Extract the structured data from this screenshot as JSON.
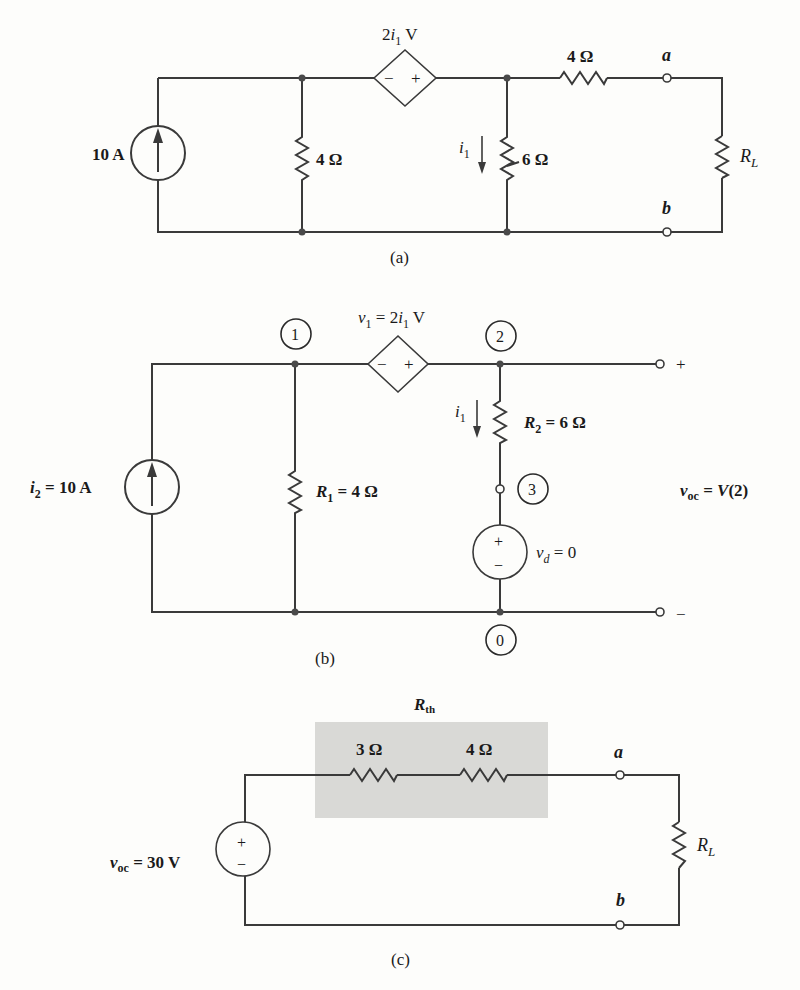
{
  "header_fragment": "… the 5-Ω resistor … figure … Thevenin … equivalent … gain …",
  "figure_a": {
    "caption": "(a)",
    "current_source": "10 A",
    "dependent_source": {
      "prefix": "2",
      "var": "i",
      "sub": "1",
      "unit": " V",
      "minus": "−",
      "plus": "+"
    },
    "resistor_shunt_left": "4 Ω",
    "resistor_shunt_right": "6 Ω",
    "resistor_series": "4 Ω",
    "current_label": {
      "var": "i",
      "sub": "1"
    },
    "terminal_a": "a",
    "terminal_b": "b",
    "load": {
      "var": "R",
      "sub": "L"
    }
  },
  "figure_b": {
    "caption": "(b)",
    "current_source": {
      "var": "i",
      "sub": "2",
      "rest": " = 10 A"
    },
    "dependent_source": {
      "var": "ν",
      "sub": "1",
      "rest": " = 2",
      "var2": "i",
      "sub2": "1",
      "unit": " V",
      "minus": "−",
      "plus": "+"
    },
    "r1": {
      "var": "R",
      "sub": "1",
      "rest": " = 4 Ω"
    },
    "r2": {
      "var": "R",
      "sub": "2",
      "rest": " = 6 Ω"
    },
    "current_label": {
      "var": "i",
      "sub": "1"
    },
    "dummy_source": {
      "var": "ν",
      "sub": "d",
      "rest": " = 0",
      "plus": "+",
      "minus": "−"
    },
    "nodes": [
      "1",
      "2",
      "3",
      "0"
    ],
    "terminal_plus": "+",
    "terminal_minus": "−",
    "output_eq": {
      "var": "ν",
      "sub": "oc",
      "rest": " = ",
      "func": "V",
      "arg": "(2)"
    }
  },
  "figure_c": {
    "caption": "(c)",
    "rth_label": {
      "var": "R",
      "sub": "th"
    },
    "r_a": "3 Ω",
    "r_b": "4 Ω",
    "source": {
      "var": "ν",
      "sub": "oc",
      "rest": " = 30 V",
      "plus": "+",
      "minus": "−"
    },
    "terminal_a": "a",
    "terminal_b": "b",
    "load": {
      "var": "R",
      "sub": "L"
    },
    "shade_color": "#d9d9d6"
  }
}
